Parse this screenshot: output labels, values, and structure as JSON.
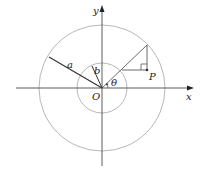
{
  "diagram": {
    "labels": {
      "y_axis": "y",
      "x_axis": "x",
      "origin": "O",
      "outer_radius": "a",
      "inner_radius": "b",
      "angle": "θ",
      "point": "P"
    },
    "colors": {
      "axis": "#333333",
      "circle": "#b0b0b0",
      "line": "#333333",
      "text": "#222222"
    }
  }
}
